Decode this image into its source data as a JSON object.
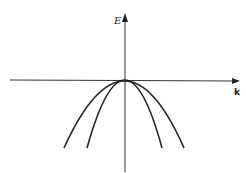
{
  "diagram": {
    "axes": {
      "y_label": "E",
      "x_label": "k"
    },
    "curves": [
      {
        "name": "outer-parabola",
        "apex": [
          0,
          0
        ],
        "opening": "down",
        "curvature": "wide"
      },
      {
        "name": "inner-parabola",
        "apex": [
          0,
          0
        ],
        "opening": "down",
        "curvature": "narrow"
      }
    ],
    "colors": {
      "line": "#222222",
      "background": "#ffffff"
    }
  }
}
